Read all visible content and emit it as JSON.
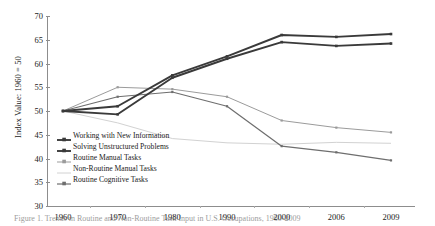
{
  "figure": {
    "caption": "Figure 1. Trends in Routine and Non-Routine Task Input in U.S. Occupations, 1960-2009"
  },
  "axes": {
    "ylabel": "Index Value: 1960 = 50",
    "xlabel": "",
    "yticks": [
      "30",
      "35",
      "40",
      "45",
      "50",
      "55",
      "60",
      "65",
      "70"
    ],
    "xticks": [
      "1960",
      "1970",
      "1980",
      "1990",
      "2000",
      "2006",
      "2009"
    ],
    "ylim_min": 30,
    "ylim_max": 70
  },
  "legend": {
    "items": [
      {
        "label": "Working with New Information",
        "color": "#3a3a3a",
        "width": 1.9,
        "marker": "square"
      },
      {
        "label": "Solving Unstructured Problems",
        "color": "#3a3a3a",
        "width": 1.9,
        "marker": "square"
      },
      {
        "label": "Routine Manual Tasks",
        "color": "#9b9b9b",
        "width": 1.0,
        "marker": "square"
      },
      {
        "label": "Non-Routine Manual Tasks",
        "color": "#d2d2d2",
        "width": 1.0,
        "marker": "none"
      },
      {
        "label": "Routine Cognitive Tasks",
        "color": "#6e6e6e",
        "width": 1.2,
        "marker": "square"
      }
    ]
  },
  "chart_data": {
    "type": "line",
    "title": "",
    "xlabel": "",
    "ylabel": "Index Value: 1960 = 50",
    "categories": [
      "1960",
      "1970",
      "1980",
      "1990",
      "2000",
      "2006",
      "2009"
    ],
    "ylim": [
      30,
      70
    ],
    "ytick_step": 5,
    "grid": false,
    "legend_position": "inside-lower-left",
    "series": [
      {
        "name": "Working with New Information",
        "color": "#3a3a3a",
        "values": [
          50.0,
          51.0,
          57.5,
          61.5,
          66.0,
          65.6,
          66.2
        ]
      },
      {
        "name": "Solving Unstructured Problems",
        "color": "#3a3a3a",
        "values": [
          50.0,
          49.3,
          57.0,
          61.0,
          64.5,
          63.7,
          64.2
        ]
      },
      {
        "name": "Routine Manual Tasks",
        "color": "#9b9b9b",
        "values": [
          50.0,
          55.0,
          54.6,
          53.0,
          48.0,
          46.5,
          45.5
        ]
      },
      {
        "name": "Non-Routine Manual Tasks",
        "color": "#d2d2d2",
        "values": [
          50.0,
          47.5,
          44.2,
          43.3,
          43.0,
          43.4,
          43.2
        ]
      },
      {
        "name": "Routine Cognitive Tasks",
        "color": "#6e6e6e",
        "values": [
          50.0,
          53.0,
          54.0,
          51.0,
          42.6,
          41.3,
          39.6
        ]
      }
    ]
  }
}
